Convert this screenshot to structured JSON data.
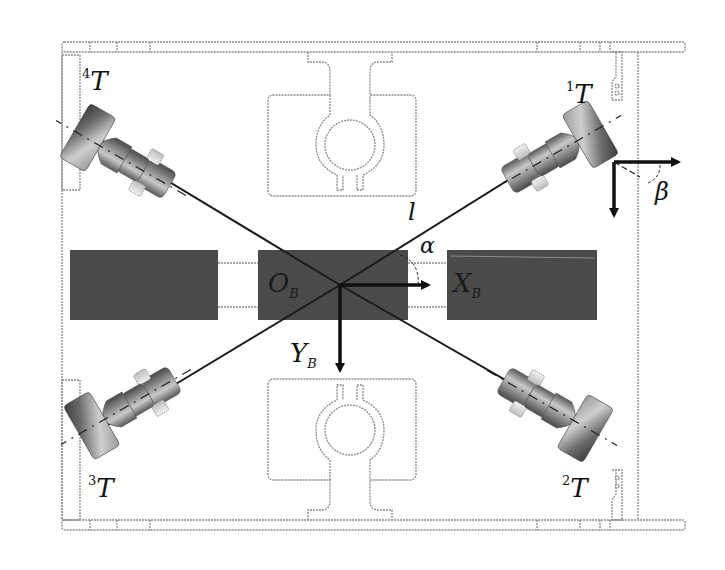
{
  "figure": {
    "colors": {
      "background": "#ffffff",
      "frame_outline": "#8a8a8a",
      "dark_block": "#4a4a4a",
      "axis_arrow": "#111111",
      "arm_line": "#1a1a1a",
      "thruster_dark": "#5a5a5a",
      "thruster_light": "#d8d8d8"
    }
  },
  "labels": {
    "origin": {
      "main": "O",
      "sub": "B"
    },
    "x_axis": {
      "main": "X",
      "sub": "B"
    },
    "y_axis": {
      "main": "Y",
      "sub": "B"
    },
    "arm_length": "l",
    "alpha": "α",
    "beta": "β"
  },
  "thrusters": [
    {
      "id": "T1",
      "index": "1",
      "symbol": "T",
      "position": "top-right"
    },
    {
      "id": "T2",
      "index": "2",
      "symbol": "T",
      "position": "bottom-right"
    },
    {
      "id": "T3",
      "index": "3",
      "symbol": "T",
      "position": "bottom-left"
    },
    {
      "id": "T4",
      "index": "4",
      "symbol": "T",
      "position": "top-left"
    }
  ]
}
